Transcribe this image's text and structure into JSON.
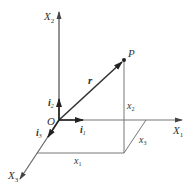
{
  "diagram": {
    "axes": {
      "x1": {
        "label": "X",
        "sub": "1"
      },
      "x2": {
        "label": "X",
        "sub": "2"
      },
      "x3": {
        "label": "X",
        "sub": "3"
      }
    },
    "origin": "O",
    "point": "P",
    "vector": "r",
    "unit_vectors": {
      "i1": {
        "label": "i",
        "sub": "1"
      },
      "i2": {
        "label": "i",
        "sub": "2"
      },
      "i3": {
        "label": "i",
        "sub": "3"
      }
    },
    "components": {
      "x1": {
        "label": "x",
        "sub": "1"
      },
      "x2": {
        "label": "x",
        "sub": "2"
      },
      "x3": {
        "label": "x",
        "sub": "3"
      }
    },
    "colors": {
      "line": "#555555",
      "text": "#333333"
    }
  }
}
